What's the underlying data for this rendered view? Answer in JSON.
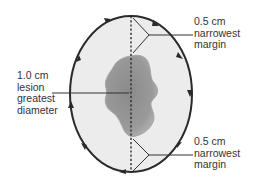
{
  "diagram": {
    "colors": {
      "ellipse_fill": "#ececec",
      "ellipse_stroke": "#2a2a2a",
      "lesion_fill": "#8f8f8f",
      "lesion_edge": "#a9a9a9",
      "leader_line": "#333333",
      "text": "#333333"
    },
    "lesion_label": {
      "lines": [
        "1.0 cm",
        "lesion",
        "greatest",
        "diameter"
      ]
    },
    "top_margin_label": {
      "lines": [
        "0.5 cm",
        "narrowest",
        "margin"
      ]
    },
    "bottom_margin_label": {
      "lines": [
        "0.5 cm",
        "narrowest",
        "margin"
      ]
    },
    "ellipse_arrow_direction": "clockwise",
    "axis_line_style": "dashed"
  }
}
